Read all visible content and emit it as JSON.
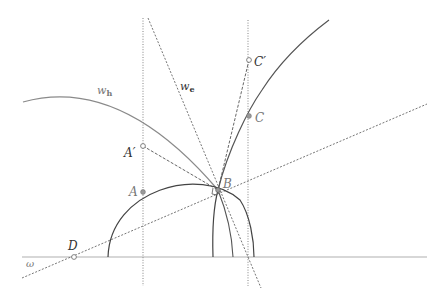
{
  "diagram": {
    "labels": {
      "A": "A",
      "A_prime": "A′",
      "B": "B",
      "C": "C",
      "C_prime": "C′",
      "D": "D",
      "omega": "ω",
      "w_h_main": "w",
      "w_h_sub": "h",
      "w_e_main": "w",
      "w_e_sub": "e"
    },
    "points": {
      "A": [
        143,
        192
      ],
      "A_prime": [
        143,
        146
      ],
      "B": [
        218,
        190
      ],
      "C": [
        249,
        116
      ],
      "C_prime": [
        249,
        60
      ],
      "D": [
        74,
        257
      ]
    },
    "colors": {
      "baseline": "#aaaaaa",
      "curve": "#555555",
      "dotted": "#666666",
      "w_h_arc": "#888888"
    }
  }
}
